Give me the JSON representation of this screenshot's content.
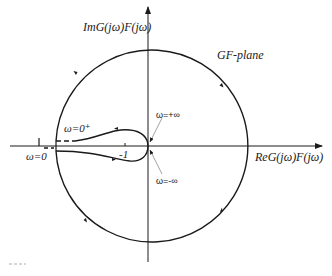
{
  "diagram": {
    "type": "nyquist-plot",
    "plane_label": "GF-plane",
    "axes": {
      "imag_label": "ImG(jω)F(jω)",
      "real_label": "ReG(jω)F(jω)"
    },
    "annotations": {
      "omega_zero_plus": "ω=0⁺",
      "omega_zero": "ω=0",
      "minus_one": "-1",
      "omega_plus_inf": "ω=+∞",
      "omega_minus_inf": "ω=-∞"
    },
    "colors": {
      "stroke": "#1a1a1a",
      "background": "#ffffff",
      "leader": "#888888"
    }
  }
}
